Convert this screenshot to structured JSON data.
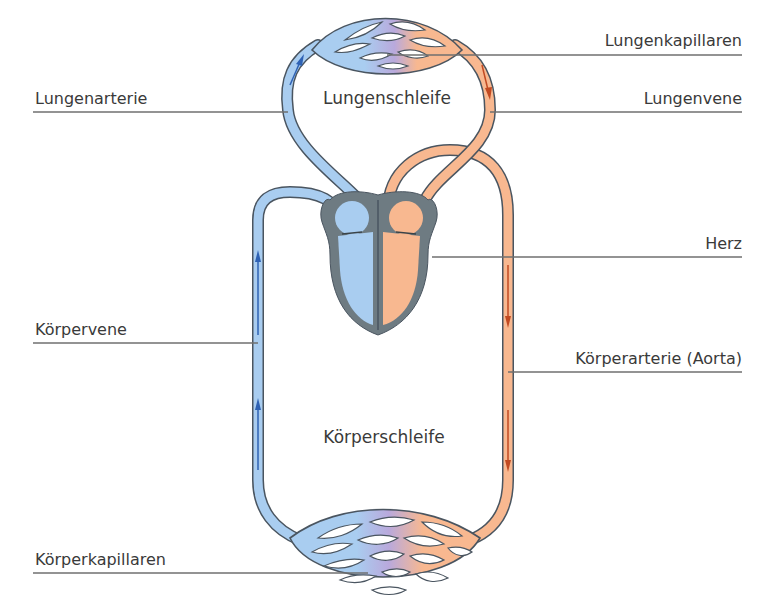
{
  "diagram": {
    "type": "blood-circulation",
    "loops": {
      "pulmonary": "Lungenschleife",
      "systemic": "Körperschleife"
    },
    "labels": {
      "lungenkapillaren": "Lungenkapillaren",
      "lungenarterie": "Lungenarterie",
      "lungenvene": "Lungenvene",
      "herz": "Herz",
      "koerpervene": "Körpervene",
      "koerperarterie": "Körperarterie (Aorta)",
      "koerperkapillaren": "Körperkapillaren"
    },
    "colors": {
      "deoxygenated": "#a9cdf0",
      "oxygenated": "#f8b890",
      "heart_wall": "#6e7b82",
      "outline": "#4a5560",
      "arrow_blue": "#2f62b4",
      "arrow_red": "#c24a22",
      "mix": "#b8a8d8"
    }
  }
}
